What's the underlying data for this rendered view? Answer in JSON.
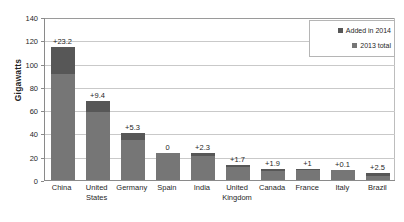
{
  "chart_data": {
    "type": "bar",
    "subtype": "stacked-bar",
    "title": "",
    "xlabel": "",
    "ylabel": "Gigawatts",
    "ylim": [
      0,
      140
    ],
    "ytick_values": [
      0,
      20,
      40,
      60,
      80,
      100,
      120,
      140
    ],
    "ytick_labels": [
      "0",
      "20",
      "40",
      "60",
      "80",
      "100",
      "120",
      "140"
    ],
    "grid": true,
    "grid_axis": "y",
    "legend_position": "top-right",
    "categories": [
      "China",
      "United States",
      "Germany",
      "Spain",
      "India",
      "United Kingdom",
      "Canada",
      "France",
      "Italy",
      "Brazil"
    ],
    "series": [
      {
        "name": "2013 total",
        "color": "#767676",
        "values": [
          91.4,
          58.6,
          34.7,
          23.0,
          20.7,
          10.8,
          7.8,
          8.3,
          8.5,
          3.5
        ]
      },
      {
        "name": "Added in 2014",
        "color": "#575757",
        "values": [
          23.2,
          9.4,
          5.3,
          0,
          2.3,
          1.7,
          1.9,
          1,
          0.1,
          2.5
        ]
      }
    ],
    "totals": [
      114.6,
      68.0,
      40.0,
      23.0,
      23.0,
      12.5,
      9.7,
      9.3,
      8.6,
      6.0
    ],
    "data_labels": [
      "+23.2",
      "+9.4",
      "+5.3",
      "0",
      "+2.3",
      "+1.7",
      "+1.9",
      "+1",
      "+0.1",
      "+2.5"
    ],
    "legend_entries": [
      {
        "label": "Added in 2014",
        "color": "#575757"
      },
      {
        "label": "2013 total",
        "color": "#767676"
      }
    ]
  },
  "colors": {
    "added_2014": "#575757",
    "total_2013": "#767676",
    "gridline": "#c9c9c9",
    "axis": "#8a8a8a",
    "text": "#1f1f1f",
    "background": "#ffffff"
  }
}
